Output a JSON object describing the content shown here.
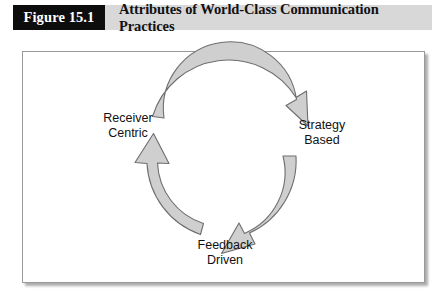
{
  "header": {
    "figure_number": "Figure 15.1",
    "title": "Attributes of World-Class Communication Practices",
    "band_color": "#d8d8d8",
    "number_box_color": "#0d0d0d",
    "number_text_color": "#ffffff"
  },
  "panel": {
    "background_color": "#ffffff",
    "border_color": "#9a9a9a"
  },
  "diagram": {
    "type": "cycle",
    "direction": "clockwise",
    "arrow_fill": "#cfcfcf",
    "arrow_stroke": "#6e6e6e",
    "nodes": [
      {
        "id": "receiver-centric",
        "line1": "Receiver",
        "line2": "Centric"
      },
      {
        "id": "strategy-based",
        "line1": "Strategy",
        "line2": "Based"
      },
      {
        "id": "feedback-driven",
        "line1": "Feedback",
        "line2": "Driven"
      }
    ],
    "arrows": [
      {
        "id": "arrow-top",
        "from": "receiver-centric",
        "to": "strategy-based"
      },
      {
        "id": "arrow-right",
        "from": "strategy-based",
        "to": "feedback-driven"
      },
      {
        "id": "arrow-left",
        "from": "feedback-driven",
        "to": "receiver-centric"
      }
    ]
  }
}
